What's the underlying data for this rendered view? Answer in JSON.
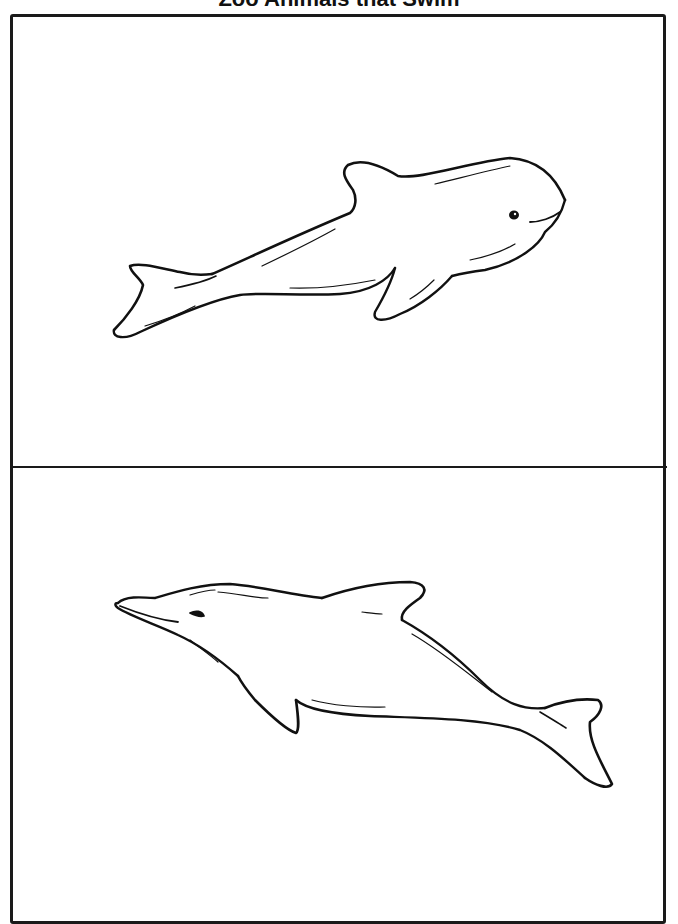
{
  "page": {
    "title": "Zoo Animals that Swim"
  },
  "panels": [
    {
      "subject": "beluga-whale",
      "caption": ""
    },
    {
      "subject": "dolphin",
      "caption": ""
    }
  ],
  "colors": {
    "ink": "#111111",
    "paper": "#ffffff"
  }
}
